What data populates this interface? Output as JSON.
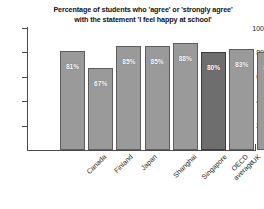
{
  "chart_data": {
    "type": "bar",
    "title": "Percentage of students who 'agree' or 'strongly agree' with the statement 'I feel happy at school'",
    "title_lines": [
      "Percentage of students who 'agree' or 'strongly agree'",
      "with the statement 'I feel happy at school'"
    ],
    "xlabel": "",
    "ylabel": "",
    "ylim": [
      0,
      100
    ],
    "yticks": [
      20,
      40,
      60,
      80,
      100
    ],
    "grid": false,
    "legend": false,
    "categories": [
      "Canada",
      "Finland",
      "Japan",
      "Shanghai",
      "Singapore",
      "OECD average",
      "UK",
      "US"
    ],
    "category_lines": [
      [
        "Canada"
      ],
      [
        "Finland"
      ],
      [
        "Japan"
      ],
      [
        "Shanghai"
      ],
      [
        "Singapore"
      ],
      [
        "OECD",
        "average"
      ],
      [
        "UK"
      ],
      [
        "US"
      ]
    ],
    "values": [
      81,
      67,
      85,
      85,
      88,
      80,
      83,
      80
    ],
    "value_labels": [
      "81%",
      "67%",
      "85%",
      "85%",
      "88%",
      "80%",
      "83%",
      "80%"
    ],
    "highlight_index": 5,
    "colors": {
      "bar": "#9a9a9a",
      "bar_highlight": "#6e6e6e",
      "bar_outline": "#5d5d5d",
      "axis": "#4a4a4a",
      "text": "#1a1a1a",
      "value_text": "#ffffff",
      "background": "#ffffff"
    }
  }
}
